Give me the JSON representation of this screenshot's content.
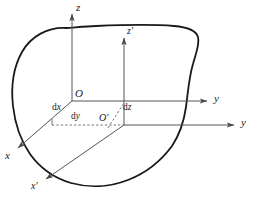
{
  "figure": {
    "type": "geometric-diagram",
    "width": 258,
    "height": 208,
    "background_color": "#ffffff",
    "curve_color": "#1a1a1a",
    "axis_color": "#555555",
    "dashed_color": "#666666",
    "label_color": "#1a1a1a"
  },
  "labels": {
    "z": "z",
    "z_prime_base": "z",
    "z_prime_mark": "'",
    "y_upper": "y",
    "y_lower": "y",
    "x": "x",
    "x_prime_base": "x",
    "x_prime_mark": "'",
    "origin_O": "O",
    "origin_O_prime_base": "O",
    "origin_O_prime_mark": "'",
    "dx_d": "d",
    "dx_v": "x",
    "dy_d": "d",
    "dy_v": "y",
    "dz_d": "d",
    "dz_v": "z"
  },
  "geometry": {
    "origin_O": [
      72,
      101
    ],
    "origin_O_prime": [
      124,
      125
    ],
    "z_axis_tip": [
      72,
      10
    ],
    "z_prime_axis_tip": [
      124,
      34
    ],
    "y_axis_tip": [
      212,
      101
    ],
    "y_lower_axis_tip": [
      238,
      125
    ],
    "x_axis_tip": [
      14,
      152
    ],
    "x_prime_axis_tip": [
      42,
      183
    ],
    "dashed_from": [
      52,
      125
    ],
    "dashed_to": [
      124,
      125
    ]
  },
  "blob_outline": {
    "description": "closed freeform convex-ish region enclosing both coordinate origins",
    "stroke_width": 1.8
  }
}
